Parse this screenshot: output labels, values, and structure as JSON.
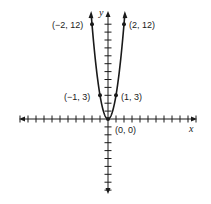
{
  "chart_data": {
    "type": "line",
    "title": "",
    "function": "y = 3x^2",
    "xlabel": "x",
    "ylabel": "y",
    "grid": false,
    "xlim": [
      -11,
      11
    ],
    "ylim": [
      -9,
      12
    ],
    "x_ticks_step": 1,
    "y_ticks_step": 1,
    "points": [
      {
        "x": -2,
        "y": 12,
        "label": "(−2, 12)"
      },
      {
        "x": -1,
        "y": 3,
        "label": "(−1, 3)"
      },
      {
        "x": 0,
        "y": 0,
        "label": "(0, 0)"
      },
      {
        "x": 1,
        "y": 3,
        "label": "(1, 3)"
      },
      {
        "x": 2,
        "y": 12,
        "label": "(2, 12)"
      }
    ],
    "series": [
      {
        "name": "parabola",
        "x": [
          -2,
          -1,
          0,
          1,
          2
        ],
        "values": [
          12,
          3,
          0,
          3,
          12
        ]
      }
    ],
    "colors": {
      "line": "#1a1a1a",
      "axis": "#1a1a1a",
      "background": "#ffffff"
    }
  },
  "labels": {
    "x_axis": "x",
    "y_axis": "y",
    "p_m2": "(−2, 12)",
    "p_m1": "(−1, 3)",
    "p_0": "(0, 0)",
    "p_1": "(1, 3)",
    "p_2": "(2, 12)"
  }
}
